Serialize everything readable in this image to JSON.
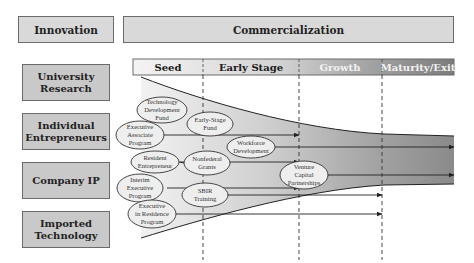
{
  "header": {
    "innovation": "Innovation",
    "commercialization": "Commercialization"
  },
  "stages": [
    {
      "label": "Seed",
      "color": "#1a1a1a"
    },
    {
      "label": "Early Stage",
      "color": "#1a1a1a"
    },
    {
      "label": "Growth",
      "color": "#f2f2f2"
    },
    {
      "label": "Maturity/Exit",
      "color": "#f2f2f2"
    }
  ],
  "sources": [
    {
      "line1": "University",
      "line2": "Research"
    },
    {
      "line1": "Individual",
      "line2": "Entrepreneurs"
    },
    {
      "line1": "Company IP",
      "line2": ""
    },
    {
      "line1": "Imported",
      "line2": "Technology"
    }
  ],
  "programs": [
    {
      "lines": [
        "Technology",
        "Development",
        "Fund"
      ]
    },
    {
      "lines": [
        "Early-Stage",
        "Fund"
      ]
    },
    {
      "lines": [
        "Executive",
        "Associate",
        "Program"
      ]
    },
    {
      "lines": [
        "Workforce",
        "Development"
      ]
    },
    {
      "lines": [
        "Resident",
        "Entrepreneur"
      ]
    },
    {
      "lines": [
        "Nonfederal",
        "Grants"
      ]
    },
    {
      "lines": [
        "Venture",
        "Capital",
        "Partnerships"
      ]
    },
    {
      "lines": [
        "Interim",
        "Executive",
        "Program"
      ]
    },
    {
      "lines": [
        "SBIR",
        "Training"
      ]
    },
    {
      "lines": [
        "Executive",
        "in Residence",
        "Program"
      ]
    }
  ],
  "colors": {
    "box_fill": "#c9c9c9",
    "header_fill": "#d9d9d9",
    "funnel_light": "#ececec",
    "funnel_dark": "#8f8f8f",
    "oval_fill": "#eeeeee",
    "stroke": "#333333"
  }
}
